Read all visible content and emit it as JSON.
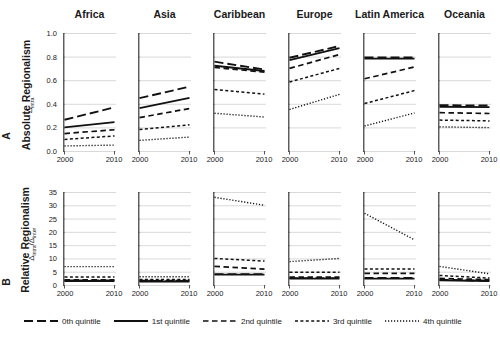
{
  "figure": {
    "background": "#ffffff",
    "line_color": "#111111",
    "grid_color": "#c9c9c9",
    "axis_color": "#555555"
  },
  "panels": {
    "A": {
      "letter": "A",
      "title": "Absolute Regionalism",
      "axis_symbol": "Δintra"
    },
    "B": {
      "letter": "B",
      "title": "Relative Regionalism",
      "axis_symbol": "Δintra/Δinter"
    }
  },
  "columns": [
    "Africa",
    "Asia",
    "Caribbean",
    "Europe",
    "Latin America",
    "Oceania"
  ],
  "legend": {
    "items": [
      {
        "label": "0th quintile",
        "style": "long-dash"
      },
      {
        "label": "1st quintile",
        "style": "solid"
      },
      {
        "label": "2nd quintile",
        "style": "medium-dash"
      },
      {
        "label": "3rd quintile",
        "style": "short-dash"
      },
      {
        "label": "4th quintile",
        "style": "dotted"
      }
    ]
  },
  "chart_data": {
    "type": "line",
    "xlabel": "",
    "x": [
      2000,
      2010
    ],
    "xtick_labels": [
      "2000",
      "2010"
    ],
    "xlim": [
      2000,
      2010
    ],
    "grid": true,
    "legend_position": "bottom",
    "series_names": [
      "0th quintile",
      "1st quintile",
      "2nd quintile",
      "3rd quintile",
      "4th quintile"
    ],
    "series_styles": [
      "long-dash",
      "solid",
      "medium-dash",
      "short-dash",
      "dotted"
    ],
    "rows": [
      {
        "row_id": "A",
        "row_letter": "A",
        "row_title": "Absolute Regionalism",
        "ylabel": "Δintra",
        "ylim": [
          0.0,
          1.0
        ],
        "yticks": [
          0.0,
          0.2,
          0.4,
          0.6,
          0.8,
          1.0
        ],
        "ytick_labels": [
          "0.0",
          "0.2",
          "0.4",
          "0.6",
          "0.8",
          "1.0"
        ],
        "panels": [
          {
            "region": "Africa",
            "series": [
              {
                "name": "0th quintile",
                "values": [
                  0.265,
                  0.37
                ]
              },
              {
                "name": "1st quintile",
                "values": [
                  0.2,
                  0.245
                ]
              },
              {
                "name": "2nd quintile",
                "values": [
                  0.148,
                  0.18
                ]
              },
              {
                "name": "3rd quintile",
                "values": [
                  0.098,
                  0.128
                ]
              },
              {
                "name": "4th quintile",
                "values": [
                  0.043,
                  0.05
                ]
              }
            ]
          },
          {
            "region": "Asia",
            "series": [
              {
                "name": "0th quintile",
                "values": [
                  0.448,
                  0.545
                ]
              },
              {
                "name": "1st quintile",
                "values": [
                  0.363,
                  0.45
                ]
              },
              {
                "name": "2nd quintile",
                "values": [
                  0.283,
                  0.36
                ]
              },
              {
                "name": "3rd quintile",
                "values": [
                  0.182,
                  0.222
                ]
              },
              {
                "name": "4th quintile",
                "values": [
                  0.09,
                  0.118
                ]
              }
            ]
          },
          {
            "region": "Caribbean",
            "series": [
              {
                "name": "0th quintile",
                "values": [
                  0.757,
                  0.69
                ]
              },
              {
                "name": "1st quintile",
                "values": [
                  0.723,
                  0.678
                ]
              },
              {
                "name": "2nd quintile",
                "values": [
                  0.708,
                  0.668
                ]
              },
              {
                "name": "3rd quintile",
                "values": [
                  0.522,
                  0.482
                ]
              },
              {
                "name": "4th quintile",
                "values": [
                  0.32,
                  0.288
                ]
              }
            ]
          },
          {
            "region": "Europe",
            "series": [
              {
                "name": "0th quintile",
                "values": [
                  0.79,
                  0.89
                ]
              },
              {
                "name": "1st quintile",
                "values": [
                  0.77,
                  0.872
                ]
              },
              {
                "name": "2nd quintile",
                "values": [
                  0.7,
                  0.818
                ]
              },
              {
                "name": "3rd quintile",
                "values": [
                  0.585,
                  0.7
                ]
              },
              {
                "name": "4th quintile",
                "values": [
                  0.352,
                  0.48
                ]
              }
            ]
          },
          {
            "region": "Latin America",
            "series": [
              {
                "name": "0th quintile",
                "values": [
                  0.792,
                  0.792
                ]
              },
              {
                "name": "1st quintile",
                "values": [
                  0.783,
                  0.783
                ]
              },
              {
                "name": "2nd quintile",
                "values": [
                  0.612,
                  0.712
                ]
              },
              {
                "name": "3rd quintile",
                "values": [
                  0.402,
                  0.512
                ]
              },
              {
                "name": "4th quintile",
                "values": [
                  0.212,
                  0.322
                ]
              }
            ]
          },
          {
            "region": "Oceania",
            "series": [
              {
                "name": "0th quintile",
                "values": [
                  0.388,
                  0.385
                ]
              },
              {
                "name": "1st quintile",
                "values": [
                  0.375,
                  0.372
                ]
              },
              {
                "name": "2nd quintile",
                "values": [
                  0.325,
                  0.318
                ]
              },
              {
                "name": "3rd quintile",
                "values": [
                  0.262,
                  0.255
                ]
              },
              {
                "name": "4th quintile",
                "values": [
                  0.205,
                  0.198
                ]
              }
            ]
          }
        ]
      },
      {
        "row_id": "B",
        "row_letter": "B",
        "row_title": "Relative Regionalism",
        "ylabel": "Δintra/Δinter",
        "ylim": [
          0,
          35
        ],
        "yticks": [
          0,
          5,
          10,
          15,
          20,
          25,
          30,
          35
        ],
        "ytick_labels": [
          "0",
          "5",
          "10",
          "15",
          "20",
          "25",
          "30",
          "35"
        ],
        "panels": [
          {
            "region": "Africa",
            "series": [
              {
                "name": "0th quintile",
                "values": [
                  1.7,
                  1.7
                ]
              },
              {
                "name": "1st quintile",
                "values": [
                  1.5,
                  1.5
                ]
              },
              {
                "name": "2nd quintile",
                "values": [
                  1.9,
                  1.9
                ]
              },
              {
                "name": "3rd quintile",
                "values": [
                  3.0,
                  3.0
                ]
              },
              {
                "name": "4th quintile",
                "values": [
                  6.9,
                  6.9
                ]
              }
            ]
          },
          {
            "region": "Asia",
            "series": [
              {
                "name": "0th quintile",
                "values": [
                  1.5,
                  1.5
                ]
              },
              {
                "name": "1st quintile",
                "values": [
                  1.3,
                  1.3
                ]
              },
              {
                "name": "2nd quintile",
                "values": [
                  1.7,
                  1.7
                ]
              },
              {
                "name": "3rd quintile",
                "values": [
                  2.1,
                  2.1
                ]
              },
              {
                "name": "4th quintile",
                "values": [
                  3.1,
                  3.1
                ]
              }
            ]
          },
          {
            "region": "Caribbean",
            "series": [
              {
                "name": "0th quintile",
                "values": [
                  4.1,
                  4.1
                ]
              },
              {
                "name": "1st quintile",
                "values": [
                  3.9,
                  3.9
                ]
              },
              {
                "name": "2nd quintile",
                "values": [
                  7.0,
                  6.0
                ]
              },
              {
                "name": "3rd quintile",
                "values": [
                  10.0,
                  9.0
                ]
              },
              {
                "name": "4th quintile",
                "values": [
                  33.0,
                  30.0
                ]
              }
            ]
          },
          {
            "region": "Europe",
            "series": [
              {
                "name": "0th quintile",
                "values": [
                  2.6,
                  2.6
                ]
              },
              {
                "name": "1st quintile",
                "values": [
                  2.4,
                  2.4
                ]
              },
              {
                "name": "2nd quintile",
                "values": [
                  3.0,
                  3.0
                ]
              },
              {
                "name": "3rd quintile",
                "values": [
                  4.8,
                  4.8
                ]
              },
              {
                "name": "4th quintile",
                "values": [
                  8.8,
                  10.0
                ]
              }
            ]
          },
          {
            "region": "Latin America",
            "series": [
              {
                "name": "0th quintile",
                "values": [
                  2.7,
                  2.7
                ]
              },
              {
                "name": "1st quintile",
                "values": [
                  2.4,
                  2.4
                ]
              },
              {
                "name": "2nd quintile",
                "values": [
                  4.4,
                  4.4
                ]
              },
              {
                "name": "3rd quintile",
                "values": [
                  6.0,
                  6.0
                ]
              },
              {
                "name": "4th quintile",
                "values": [
                  27.0,
                  17.0
                ]
              }
            ]
          },
          {
            "region": "Oceania",
            "series": [
              {
                "name": "0th quintile",
                "values": [
                  2.0,
                  1.6
                ]
              },
              {
                "name": "1st quintile",
                "values": [
                  1.8,
                  1.5
                ]
              },
              {
                "name": "2nd quintile",
                "values": [
                  2.5,
                  2.0
                ]
              },
              {
                "name": "3rd quintile",
                "values": [
                  3.6,
                  2.6
                ]
              },
              {
                "name": "4th quintile",
                "values": [
                  7.0,
                  4.2
                ]
              }
            ]
          }
        ]
      }
    ]
  }
}
